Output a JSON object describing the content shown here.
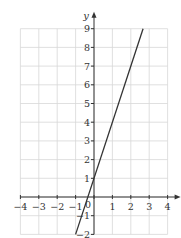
{
  "chart_data": {
    "type": "line",
    "title": "",
    "xlabel": "",
    "ylabel": "y",
    "xlim": [
      -4,
      4
    ],
    "ylim": [
      -2,
      9
    ],
    "xticks": [
      -4,
      -3,
      -2,
      -1,
      0,
      1,
      2,
      3,
      4
    ],
    "yticks": [
      -2,
      -1,
      1,
      2,
      3,
      4,
      5,
      6,
      7,
      8,
      9
    ],
    "x_tick_labels": [
      "−4",
      "−3",
      "−2",
      "−1",
      "",
      "1",
      "2",
      "3",
      "4"
    ],
    "y_tick_labels": [
      "−2",
      "−1",
      "1",
      "2",
      "3",
      "4",
      "5",
      "6",
      "7",
      "8",
      "9"
    ],
    "origin_label": "0",
    "grid": true,
    "series": [
      {
        "name": "y = 3x + 1",
        "points": [
          [
            -1,
            -2
          ],
          [
            2.667,
            9
          ]
        ],
        "color": "#333333"
      }
    ]
  }
}
